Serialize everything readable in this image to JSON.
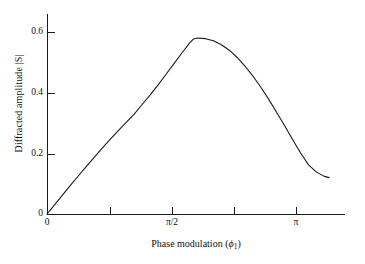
{
  "chart_data": {
    "type": "line",
    "title": "",
    "xlabel": "Phase modulation (ϕ₁)",
    "ylabel": "Diffracted amplitude |S|",
    "grid": false,
    "legend": null,
    "xlim": [
      0,
      3.75
    ],
    "ylim": [
      0,
      0.66
    ],
    "x_tick_positions": [
      0,
      0.7853981634,
      1.5707963268,
      2.3561944902,
      3.1415926536
    ],
    "x_tick_labels": [
      "0",
      "",
      "π/2",
      "",
      "π"
    ],
    "y_tick_positions": [
      0,
      0.2,
      0.4,
      0.6
    ],
    "y_tick_labels": [
      "0",
      "0.2",
      "0.4",
      "0.6"
    ],
    "series": [
      {
        "name": "|S|",
        "x": [
          0.0,
          0.1,
          0.2,
          0.3,
          0.4,
          0.5,
          0.6,
          0.7,
          0.8,
          0.9,
          1.0,
          1.1,
          1.2,
          1.3,
          1.4,
          1.5,
          1.6,
          1.7,
          1.8,
          1.85,
          1.9,
          2.0,
          2.1,
          2.2,
          2.3,
          2.4,
          2.5,
          2.6,
          2.7,
          2.8,
          2.9,
          3.0,
          3.1,
          3.2,
          3.3,
          3.4,
          3.5,
          3.56
        ],
        "y": [
          0.0,
          0.032,
          0.064,
          0.096,
          0.127,
          0.158,
          0.188,
          0.218,
          0.247,
          0.275,
          0.302,
          0.329,
          0.361,
          0.392,
          0.425,
          0.46,
          0.495,
          0.53,
          0.564,
          0.577,
          0.58,
          0.578,
          0.571,
          0.558,
          0.54,
          0.516,
          0.487,
          0.454,
          0.417,
          0.377,
          0.334,
          0.29,
          0.245,
          0.201,
          0.162,
          0.138,
          0.124,
          0.12
        ]
      }
    ],
    "peak": {
      "x": 1.9,
      "y": 0.58
    },
    "colors": {
      "curve": "#1a1a1a",
      "axis": "#1a1a1a",
      "background": "#ffffff"
    }
  },
  "axes": {
    "y_title": "Diffracted amplitude |S|",
    "x_title_prefix": "Phase modulation (",
    "x_title_symbol": "ϕ",
    "x_title_subscript": "1",
    "x_title_suffix": ")",
    "y_ticks": [
      {
        "label": "0.6",
        "value": 0.6
      },
      {
        "label": "0.4",
        "value": 0.4
      },
      {
        "label": "0.2",
        "value": 0.2
      },
      {
        "label": "0",
        "value": 0
      }
    ],
    "x_ticks": [
      {
        "label": "0",
        "value": 0
      },
      {
        "label": "",
        "value": 0.7853981634
      },
      {
        "label": "π/2",
        "value": 1.5707963268
      },
      {
        "label": "",
        "value": 2.3561944902
      },
      {
        "label": "π",
        "value": 3.1415926536
      }
    ]
  }
}
